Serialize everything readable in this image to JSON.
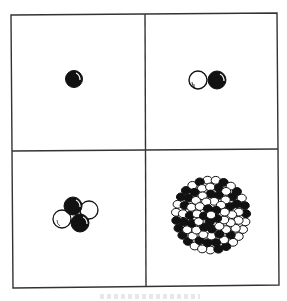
{
  "figure": {
    "colors": {
      "proton": "#111111",
      "neutron": "#ffffff",
      "outline": "#111111",
      "frame": "#333333"
    },
    "panels": [
      {
        "id": "top-left",
        "label": "single-nucleon nucleus",
        "protons": 1,
        "neutrons": 0
      },
      {
        "id": "top-right",
        "label": "two-nucleon nucleus",
        "protons": 1,
        "neutrons": 1
      },
      {
        "id": "bottom-left",
        "label": "four-nucleon nucleus",
        "protons": 2,
        "neutrons": 2
      },
      {
        "id": "bottom-right",
        "label": "heavy nucleus cluster",
        "protons": "many",
        "neutrons": "many"
      }
    ]
  }
}
